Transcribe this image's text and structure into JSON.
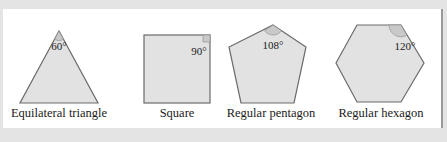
{
  "figure": {
    "colors": {
      "background": "#e4e4e4",
      "panel": "#ffffff",
      "shape_fill": "#e2e2e2",
      "shape_stroke": "#6b6b6b",
      "angle_marker": "#c9c9c9"
    },
    "shapes": [
      {
        "name": "Equilateral triangle",
        "interior_angle": "60°"
      },
      {
        "name": "Square",
        "interior_angle": "90°"
      },
      {
        "name": "Regular pentagon",
        "interior_angle": "108°"
      },
      {
        "name": "Regular hexagon",
        "interior_angle": "120°"
      }
    ]
  }
}
